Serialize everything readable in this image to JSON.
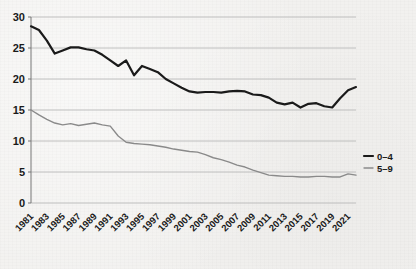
{
  "chart_data": {
    "type": "line",
    "title": "",
    "subtitle": "",
    "xlabel": "",
    "ylabel": "",
    "grid": "horizontal",
    "legend_position": "right",
    "xlim": [
      1981,
      2022
    ],
    "ylim": [
      0,
      30
    ],
    "ytick_labels": [
      "0",
      "5",
      "10",
      "15",
      "20",
      "25",
      "30"
    ],
    "ytick_values": [
      0,
      5,
      10,
      15,
      20,
      25,
      30
    ],
    "xtick_labels": [
      "1981",
      "1983",
      "1985",
      "1987",
      "1989",
      "1991",
      "1993",
      "1995",
      "1997",
      "1999",
      "2001",
      "2003",
      "2005",
      "2007",
      "2009",
      "2011",
      "2013",
      "2015",
      "2017",
      "2019",
      "2021"
    ],
    "x": [
      1981,
      1982,
      1983,
      1984,
      1985,
      1986,
      1987,
      1988,
      1989,
      1990,
      1991,
      1992,
      1993,
      1994,
      1995,
      1996,
      1997,
      1998,
      1999,
      2000,
      2001,
      2002,
      2003,
      2004,
      2005,
      2006,
      2007,
      2008,
      2009,
      2010,
      2011,
      2012,
      2013,
      2014,
      2015,
      2016,
      2017,
      2018,
      2019,
      2020,
      2021,
      2022
    ],
    "series": [
      {
        "name": "0–4",
        "color": "#1a1a1a",
        "width": 2.2,
        "values": [
          28.5,
          27.9,
          26.2,
          24.1,
          24.6,
          25.1,
          25.1,
          24.8,
          24.6,
          23.9,
          23.0,
          22.1,
          23.0,
          20.6,
          22.1,
          21.6,
          21.1,
          20.0,
          19.3,
          18.6,
          18.0,
          17.8,
          17.9,
          17.9,
          17.8,
          18.0,
          18.1,
          18.0,
          17.5,
          17.4,
          17.0,
          16.2,
          15.9,
          16.2,
          15.4,
          16.0,
          16.1,
          15.6,
          15.4,
          16.9,
          18.2,
          18.7
        ]
      },
      {
        "name": "5–9",
        "color": "#8a8a8a",
        "width": 1.4,
        "values": [
          15.0,
          14.2,
          13.5,
          12.9,
          12.6,
          12.8,
          12.5,
          12.7,
          12.9,
          12.6,
          12.4,
          10.8,
          9.8,
          9.6,
          9.5,
          9.4,
          9.2,
          9.0,
          8.7,
          8.5,
          8.3,
          8.2,
          7.8,
          7.3,
          7.0,
          6.6,
          6.1,
          5.8,
          5.3,
          4.9,
          4.5,
          4.4,
          4.3,
          4.3,
          4.2,
          4.2,
          4.3,
          4.3,
          4.2,
          4.2,
          4.7,
          4.5
        ]
      }
    ],
    "legend": [
      {
        "label": "0–4",
        "color": "#1a1a1a"
      },
      {
        "label": "5–9",
        "color": "#8a8a8a"
      }
    ]
  },
  "colors": {
    "background": "#f2f1ef",
    "grid": "#b9b9b9",
    "axis": "#555555",
    "series_0_4": "#1a1a1a",
    "series_5_9": "#8a8a8a",
    "text": "#1a1a1a"
  }
}
